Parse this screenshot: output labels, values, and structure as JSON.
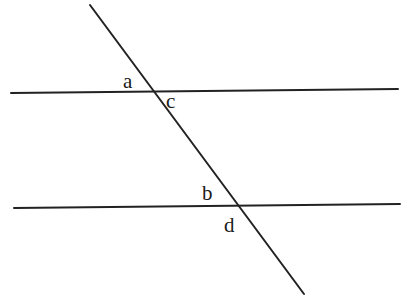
{
  "diagram": {
    "colors": {
      "line": "#222222",
      "label": "#1a1a1a",
      "background": "#ffffff"
    },
    "lines": {
      "top_parallel": {
        "x1": 11,
        "y1": 93,
        "x2": 398,
        "y2": 89
      },
      "bottom_parallel": {
        "x1": 14,
        "y1": 208,
        "x2": 400,
        "y2": 204
      },
      "transversal": {
        "x1": 90,
        "y1": 5,
        "x2": 304,
        "y2": 294
      }
    },
    "labels": {
      "a": {
        "text": "a",
        "x": 123,
        "y": 88
      },
      "c": {
        "text": "c",
        "x": 166,
        "y": 108
      },
      "b": {
        "text": "b",
        "x": 202,
        "y": 200
      },
      "d": {
        "text": "d",
        "x": 224,
        "y": 232
      }
    }
  }
}
